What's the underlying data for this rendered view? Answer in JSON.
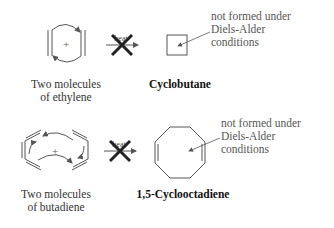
{
  "reactions": [
    {
      "reactant_label_line1": "Two molecules",
      "reactant_label_line2": "of ethylene",
      "arrow_label": "heat",
      "product_label": "Cyclobutane",
      "note_line1": "not formed under",
      "note_line2": "Diels-Alder",
      "note_line3": "conditions",
      "plus": "+"
    },
    {
      "reactant_label_line1": "Two molecules",
      "reactant_label_line2": "of butadiene",
      "arrow_label": "heat",
      "product_label": "1,5-Cyclooctadiene",
      "note_line1": "not formed under",
      "note_line2": "Diels-Alder",
      "note_line3": "conditions",
      "plus": "+"
    }
  ],
  "colors": {
    "line": "#555555",
    "cross": "#222222"
  }
}
